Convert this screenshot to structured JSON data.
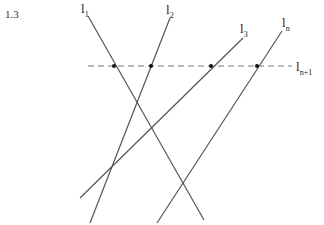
{
  "figure_number": "1.3",
  "lines": [
    {
      "name": "l",
      "sub": "1",
      "x1": 88,
      "y1": 16,
      "x2": 204,
      "y2": 220,
      "label_x": 81,
      "label_y": 2
    },
    {
      "name": "l",
      "sub": "2",
      "x1": 170,
      "y1": 18,
      "x2": 90,
      "y2": 223,
      "label_x": 166,
      "label_y": 3
    },
    {
      "name": "l",
      "sub": "3",
      "x1": 243,
      "y1": 38,
      "x2": 80,
      "y2": 198,
      "label_x": 240,
      "label_y": 22
    },
    {
      "name": "l",
      "sub": "n",
      "x1": 282,
      "y1": 31,
      "x2": 157,
      "y2": 223,
      "label_x": 282,
      "label_y": 16
    }
  ],
  "transversal": {
    "name": "l",
    "sub": "n+1",
    "x1": 88,
    "y1": 66,
    "x2": 292,
    "y2": 66,
    "label_x": 296,
    "label_y": 60
  },
  "intersections": [
    {
      "x": 114,
      "y": 66
    },
    {
      "x": 151,
      "y": 66
    },
    {
      "x": 211,
      "y": 66
    },
    {
      "x": 257,
      "y": 66
    }
  ],
  "colors": {
    "line": "#555555",
    "dash": "#777777",
    "dot": "#111111"
  }
}
